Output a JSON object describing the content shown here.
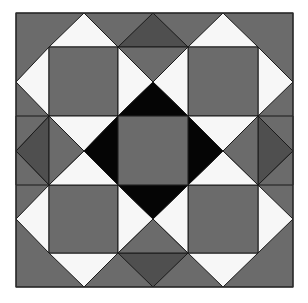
{
  "image": {
    "subject": "quilt block pattern",
    "width": 308,
    "height": 303
  },
  "colors": {
    "medium_gray": "#6b6b6b",
    "dark_gray": "#4f4f4f",
    "white": "#f7f7f7",
    "black": "#050505",
    "background": "#ffffff",
    "seam": "#1a1a1a"
  },
  "block": {
    "bounds": {
      "x0": 16,
      "y0": 13,
      "x1": 293,
      "y1": 287
    },
    "grid_x": [
      16,
      49,
      118,
      188,
      258,
      293
    ],
    "grid_y": [
      13,
      47,
      116,
      185,
      253,
      287
    ],
    "pieces": {
      "corner_squares": [
        "top-left",
        "top-right",
        "bottom-left",
        "bottom-right"
      ],
      "center_square": "medium gray square framed by black diamond",
      "edge_diamonds": [
        "top",
        "right",
        "bottom",
        "left"
      ]
    }
  }
}
